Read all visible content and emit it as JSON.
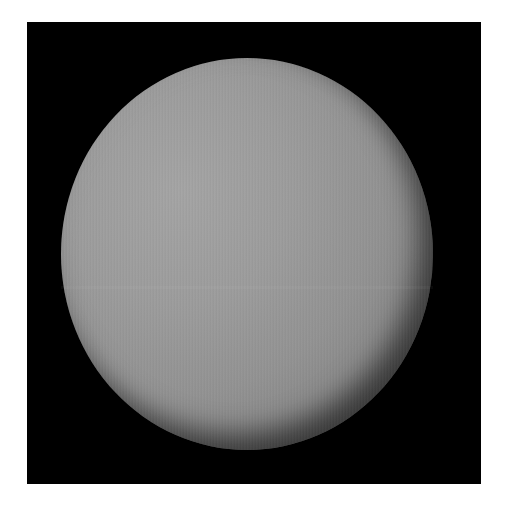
{
  "image": {
    "subject": "planet",
    "description": "Gray, featureless cloud-covered planet disk (Venus-like) on a black square background with a white border",
    "colors": {
      "background": "#ffffff",
      "frame": "#000000",
      "planet_highlight": "#a4a4a4",
      "planet_mid": "#929292",
      "planet_limb": "#141414"
    }
  }
}
